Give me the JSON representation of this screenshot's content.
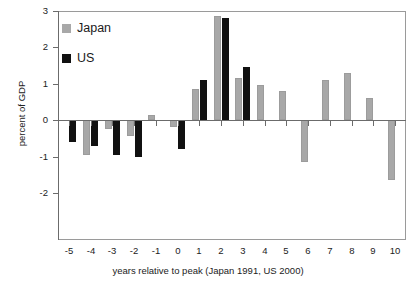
{
  "chart_data": {
    "type": "bar",
    "title": "",
    "subtitle": "",
    "xlabel": "years relative to peak (Japan 1991, US 2000)",
    "ylabel": "percent of GDP",
    "categories": [
      "-5",
      "-4",
      "-3",
      "-2",
      "-1",
      "0",
      "1",
      "2",
      "3",
      "4",
      "5",
      "6",
      "7",
      "8",
      "9",
      "10"
    ],
    "series": [
      {
        "name": "Japan",
        "color": "#a8a8a8",
        "values": [
          null,
          -0.95,
          -0.25,
          -0.45,
          0.15,
          -0.2,
          0.85,
          2.85,
          1.15,
          0.95,
          0.8,
          -1.15,
          1.1,
          1.3,
          0.6,
          -1.65
        ]
      },
      {
        "name": "US",
        "color": "#111111",
        "values": [
          -0.6,
          -0.7,
          -0.95,
          -1.0,
          null,
          -0.8,
          1.1,
          2.8,
          1.45,
          null,
          null,
          null,
          null,
          null,
          null,
          null
        ]
      }
    ],
    "ylim": [
      -2,
      3
    ],
    "yticks": [
      -2,
      -1,
      0,
      1,
      2,
      3
    ],
    "ytick_labels": [
      "-2",
      "-1",
      "0",
      "1",
      "2",
      "3"
    ],
    "grid": false,
    "legend_position": "upper left",
    "legend_entries": [
      "Japan",
      "US"
    ]
  },
  "axes": {
    "y_title": "percent of GDP",
    "x_title": "years relative to peak (Japan 1991, US 2000)"
  },
  "legend": {
    "japan_label": "Japan",
    "us_label": "US"
  }
}
